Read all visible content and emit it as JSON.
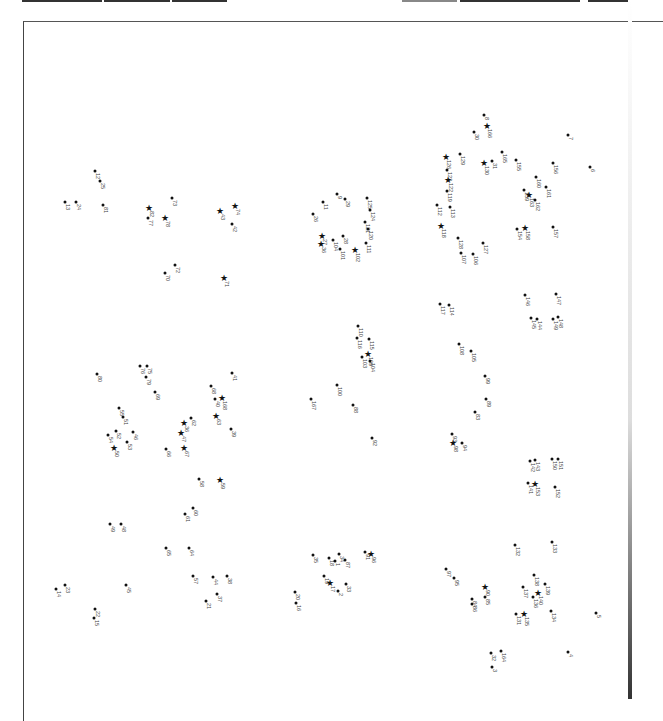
{
  "page": {
    "type": "connect-the-dots puzzle (rotated 90°)",
    "background": "#ffffff",
    "ink": "#111111"
  },
  "points": [
    {
      "n": "8",
      "x": 484,
      "y": 115,
      "s": false
    },
    {
      "n": "166",
      "x": 487,
      "y": 127,
      "s": true
    },
    {
      "n": "30",
      "x": 474,
      "y": 132,
      "s": false
    },
    {
      "n": "7",
      "x": 568,
      "y": 135,
      "s": false
    },
    {
      "n": "129",
      "x": 460,
      "y": 154,
      "s": false
    },
    {
      "n": "126",
      "x": 446,
      "y": 158,
      "s": true
    },
    {
      "n": "165",
      "x": 502,
      "y": 152,
      "s": false
    },
    {
      "n": "31",
      "x": 492,
      "y": 161,
      "s": false
    },
    {
      "n": "155",
      "x": 516,
      "y": 160,
      "s": false
    },
    {
      "n": "130",
      "x": 484,
      "y": 164,
      "s": true
    },
    {
      "n": "123",
      "x": 447,
      "y": 170,
      "s": false
    },
    {
      "n": "156",
      "x": 553,
      "y": 163,
      "s": false
    },
    {
      "n": "6",
      "x": 590,
      "y": 167,
      "s": false
    },
    {
      "n": "122",
      "x": 448,
      "y": 181,
      "s": true
    },
    {
      "n": "160",
      "x": 536,
      "y": 177,
      "s": false
    },
    {
      "n": "119",
      "x": 447,
      "y": 191,
      "s": false
    },
    {
      "n": "161",
      "x": 546,
      "y": 187,
      "s": false
    },
    {
      "n": "159",
      "x": 524,
      "y": 190,
      "s": false
    },
    {
      "n": "163",
      "x": 529,
      "y": 196,
      "s": true
    },
    {
      "n": "112",
      "x": 437,
      "y": 205,
      "s": false
    },
    {
      "n": "113",
      "x": 450,
      "y": 207,
      "s": false
    },
    {
      "n": "162",
      "x": 535,
      "y": 200,
      "s": false
    },
    {
      "n": "118",
      "x": 441,
      "y": 227,
      "s": true
    },
    {
      "n": "154",
      "x": 517,
      "y": 229,
      "s": false
    },
    {
      "n": "158",
      "x": 525,
      "y": 229,
      "s": true
    },
    {
      "n": "157",
      "x": 553,
      "y": 227,
      "s": false
    },
    {
      "n": "128",
      "x": 458,
      "y": 238,
      "s": false
    },
    {
      "n": "127",
      "x": 483,
      "y": 243,
      "s": false
    },
    {
      "n": "107",
      "x": 461,
      "y": 253,
      "s": false
    },
    {
      "n": "106",
      "x": 473,
      "y": 254,
      "s": false
    },
    {
      "n": "12",
      "x": 95,
      "y": 171,
      "s": false
    },
    {
      "n": "25",
      "x": 100,
      "y": 181,
      "s": false
    },
    {
      "n": "13",
      "x": 65,
      "y": 202,
      "s": false
    },
    {
      "n": "24",
      "x": 76,
      "y": 202,
      "s": false
    },
    {
      "n": "81",
      "x": 103,
      "y": 205,
      "s": false
    },
    {
      "n": "82",
      "x": 149,
      "y": 209,
      "s": true
    },
    {
      "n": "73",
      "x": 172,
      "y": 198,
      "s": false
    },
    {
      "n": "77",
      "x": 148,
      "y": 218,
      "s": false
    },
    {
      "n": "78",
      "x": 165,
      "y": 219,
      "s": true
    },
    {
      "n": "43",
      "x": 220,
      "y": 212,
      "s": true
    },
    {
      "n": "74",
      "x": 235,
      "y": 207,
      "s": true
    },
    {
      "n": "42",
      "x": 232,
      "y": 224,
      "s": false
    },
    {
      "n": "72",
      "x": 175,
      "y": 265,
      "s": false
    },
    {
      "n": "70",
      "x": 165,
      "y": 273,
      "s": false
    },
    {
      "n": "71",
      "x": 224,
      "y": 279,
      "s": true
    },
    {
      "n": "9",
      "x": 337,
      "y": 194,
      "s": false
    },
    {
      "n": "11",
      "x": 323,
      "y": 202,
      "s": false
    },
    {
      "n": "29",
      "x": 345,
      "y": 199,
      "s": false
    },
    {
      "n": "125",
      "x": 367,
      "y": 198,
      "s": false
    },
    {
      "n": "26",
      "x": 313,
      "y": 214,
      "s": false
    },
    {
      "n": "124",
      "x": 370,
      "y": 210,
      "s": false
    },
    {
      "n": "121",
      "x": 365,
      "y": 222,
      "s": false
    },
    {
      "n": "120",
      "x": 368,
      "y": 229,
      "s": false
    },
    {
      "n": "27",
      "x": 322,
      "y": 237,
      "s": true
    },
    {
      "n": "36",
      "x": 321,
      "y": 245,
      "s": true
    },
    {
      "n": "104",
      "x": 333,
      "y": 240,
      "s": false
    },
    {
      "n": "28",
      "x": 343,
      "y": 236,
      "s": false
    },
    {
      "n": "101",
      "x": 340,
      "y": 249,
      "s": false
    },
    {
      "n": "102",
      "x": 355,
      "y": 251,
      "s": true
    },
    {
      "n": "111",
      "x": 366,
      "y": 243,
      "s": false
    },
    {
      "n": "80",
      "x": 97,
      "y": 374,
      "s": false
    },
    {
      "n": "76",
      "x": 140,
      "y": 366,
      "s": false
    },
    {
      "n": "75",
      "x": 147,
      "y": 366,
      "s": false
    },
    {
      "n": "79",
      "x": 146,
      "y": 377,
      "s": false
    },
    {
      "n": "69",
      "x": 155,
      "y": 392,
      "s": false
    },
    {
      "n": "41",
      "x": 232,
      "y": 373,
      "s": false
    },
    {
      "n": "68",
      "x": 211,
      "y": 386,
      "s": false
    },
    {
      "n": "40",
      "x": 215,
      "y": 399,
      "s": false
    },
    {
      "n": "168",
      "x": 222,
      "y": 399,
      "s": true
    },
    {
      "n": "55",
      "x": 119,
      "y": 408,
      "s": false
    },
    {
      "n": "51",
      "x": 123,
      "y": 417,
      "s": false
    },
    {
      "n": "36",
      "x": 184,
      "y": 424,
      "s": true
    },
    {
      "n": "62",
      "x": 191,
      "y": 418,
      "s": false
    },
    {
      "n": "63",
      "x": 216,
      "y": 417,
      "s": true
    },
    {
      "n": "54",
      "x": 108,
      "y": 435,
      "s": false
    },
    {
      "n": "52",
      "x": 116,
      "y": 431,
      "s": false
    },
    {
      "n": "46",
      "x": 133,
      "y": 432,
      "s": false
    },
    {
      "n": "47",
      "x": 181,
      "y": 434,
      "s": true
    },
    {
      "n": "39",
      "x": 231,
      "y": 429,
      "s": false
    },
    {
      "n": "50",
      "x": 114,
      "y": 449,
      "s": true
    },
    {
      "n": "53",
      "x": 127,
      "y": 442,
      "s": false
    },
    {
      "n": "66",
      "x": 166,
      "y": 449,
      "s": false
    },
    {
      "n": "67",
      "x": 184,
      "y": 449,
      "s": true
    },
    {
      "n": "58",
      "x": 199,
      "y": 479,
      "s": false
    },
    {
      "n": "59",
      "x": 220,
      "y": 481,
      "s": true
    },
    {
      "n": "110",
      "x": 358,
      "y": 326,
      "s": false
    },
    {
      "n": "116",
      "x": 357,
      "y": 338,
      "s": false
    },
    {
      "n": "115",
      "x": 369,
      "y": 339,
      "s": false
    },
    {
      "n": "109",
      "x": 368,
      "y": 355,
      "s": true
    },
    {
      "n": "103",
      "x": 362,
      "y": 357,
      "s": false
    },
    {
      "n": "104",
      "x": 370,
      "y": 361,
      "s": false
    },
    {
      "n": "167",
      "x": 311,
      "y": 399,
      "s": false
    },
    {
      "n": "100",
      "x": 337,
      "y": 385,
      "s": false
    },
    {
      "n": "88",
      "x": 353,
      "y": 405,
      "s": false
    },
    {
      "n": "92",
      "x": 372,
      "y": 438,
      "s": false
    },
    {
      "n": "117",
      "x": 440,
      "y": 304,
      "s": false
    },
    {
      "n": "114",
      "x": 449,
      "y": 305,
      "s": false
    },
    {
      "n": "146",
      "x": 525,
      "y": 295,
      "s": false
    },
    {
      "n": "147",
      "x": 556,
      "y": 294,
      "s": false
    },
    {
      "n": "145",
      "x": 531,
      "y": 318,
      "s": false
    },
    {
      "n": "144",
      "x": 537,
      "y": 319,
      "s": false
    },
    {
      "n": "149",
      "x": 553,
      "y": 319,
      "s": false
    },
    {
      "n": "148",
      "x": 558,
      "y": 317,
      "s": false
    },
    {
      "n": "108",
      "x": 459,
      "y": 344,
      "s": false
    },
    {
      "n": "105",
      "x": 471,
      "y": 351,
      "s": false
    },
    {
      "n": "99",
      "x": 485,
      "y": 376,
      "s": false
    },
    {
      "n": "89",
      "x": 486,
      "y": 399,
      "s": false
    },
    {
      "n": "83",
      "x": 475,
      "y": 412,
      "s": false
    },
    {
      "n": "93",
      "x": 452,
      "y": 434,
      "s": false
    },
    {
      "n": "94",
      "x": 462,
      "y": 443,
      "s": false
    },
    {
      "n": "98",
      "x": 453,
      "y": 444,
      "s": true
    },
    {
      "n": "142",
      "x": 530,
      "y": 461,
      "s": false
    },
    {
      "n": "143",
      "x": 535,
      "y": 460,
      "s": false
    },
    {
      "n": "150",
      "x": 552,
      "y": 459,
      "s": false
    },
    {
      "n": "151",
      "x": 558,
      "y": 459,
      "s": false
    },
    {
      "n": "141",
      "x": 528,
      "y": 483,
      "s": false
    },
    {
      "n": "153",
      "x": 535,
      "y": 485,
      "s": true
    },
    {
      "n": "152",
      "x": 555,
      "y": 487,
      "s": false
    },
    {
      "n": "132",
      "x": 515,
      "y": 545,
      "s": false
    },
    {
      "n": "133",
      "x": 552,
      "y": 542,
      "s": false
    },
    {
      "n": "49",
      "x": 110,
      "y": 524,
      "s": false
    },
    {
      "n": "48",
      "x": 121,
      "y": 524,
      "s": false
    },
    {
      "n": "61",
      "x": 185,
      "y": 514,
      "s": false
    },
    {
      "n": "60",
      "x": 193,
      "y": 508,
      "s": false
    },
    {
      "n": "65",
      "x": 166,
      "y": 548,
      "s": false
    },
    {
      "n": "64",
      "x": 189,
      "y": 548,
      "s": false
    },
    {
      "n": "57",
      "x": 193,
      "y": 576,
      "s": false
    },
    {
      "n": "44",
      "x": 213,
      "y": 577,
      "s": false
    },
    {
      "n": "38",
      "x": 227,
      "y": 576,
      "s": false
    },
    {
      "n": "37",
      "x": 217,
      "y": 594,
      "s": false
    },
    {
      "n": "21",
      "x": 206,
      "y": 601,
      "s": false
    },
    {
      "n": "14",
      "x": 56,
      "y": 589,
      "s": false
    },
    {
      "n": "23",
      "x": 65,
      "y": 585,
      "s": false
    },
    {
      "n": "45",
      "x": 126,
      "y": 585,
      "s": false
    },
    {
      "n": "22",
      "x": 95,
      "y": 609,
      "s": false
    },
    {
      "n": "15",
      "x": 94,
      "y": 618,
      "s": false
    },
    {
      "n": "35",
      "x": 313,
      "y": 555,
      "s": false
    },
    {
      "n": "18",
      "x": 329,
      "y": 558,
      "s": false
    },
    {
      "n": "34",
      "x": 339,
      "y": 554,
      "s": false
    },
    {
      "n": "1",
      "x": 335,
      "y": 561,
      "s": false
    },
    {
      "n": "87",
      "x": 345,
      "y": 560,
      "s": false
    },
    {
      "n": "91",
      "x": 365,
      "y": 552,
      "s": false
    },
    {
      "n": "96",
      "x": 371,
      "y": 555,
      "s": true
    },
    {
      "n": "19",
      "x": 324,
      "y": 576,
      "s": false
    },
    {
      "n": "17",
      "x": 330,
      "y": 584,
      "s": true
    },
    {
      "n": "33",
      "x": 346,
      "y": 584,
      "s": false
    },
    {
      "n": "2",
      "x": 338,
      "y": 591,
      "s": false
    },
    {
      "n": "20",
      "x": 295,
      "y": 592,
      "s": false
    },
    {
      "n": "16",
      "x": 296,
      "y": 603,
      "s": false
    },
    {
      "n": "97",
      "x": 446,
      "y": 569,
      "s": false
    },
    {
      "n": "95",
      "x": 454,
      "y": 578,
      "s": false
    },
    {
      "n": "90",
      "x": 485,
      "y": 588,
      "s": true
    },
    {
      "n": "84",
      "x": 472,
      "y": 599,
      "s": false
    },
    {
      "n": "86",
      "x": 472,
      "y": 604,
      "s": false
    },
    {
      "n": "85",
      "x": 485,
      "y": 597,
      "s": false
    },
    {
      "n": "137",
      "x": 523,
      "y": 587,
      "s": false
    },
    {
      "n": "138",
      "x": 534,
      "y": 575,
      "s": false
    },
    {
      "n": "139",
      "x": 545,
      "y": 584,
      "s": false
    },
    {
      "n": "136",
      "x": 533,
      "y": 597,
      "s": false
    },
    {
      "n": "140",
      "x": 538,
      "y": 594,
      "s": true
    },
    {
      "n": "131",
      "x": 516,
      "y": 614,
      "s": false
    },
    {
      "n": "135",
      "x": 524,
      "y": 615,
      "s": true
    },
    {
      "n": "134",
      "x": 551,
      "y": 611,
      "s": false
    },
    {
      "n": "5",
      "x": 596,
      "y": 613,
      "s": false
    },
    {
      "n": "32",
      "x": 491,
      "y": 653,
      "s": false
    },
    {
      "n": "164",
      "x": 501,
      "y": 651,
      "s": false
    },
    {
      "n": "3",
      "x": 492,
      "y": 667,
      "s": false
    },
    {
      "n": "4",
      "x": 568,
      "y": 652,
      "s": false
    }
  ]
}
